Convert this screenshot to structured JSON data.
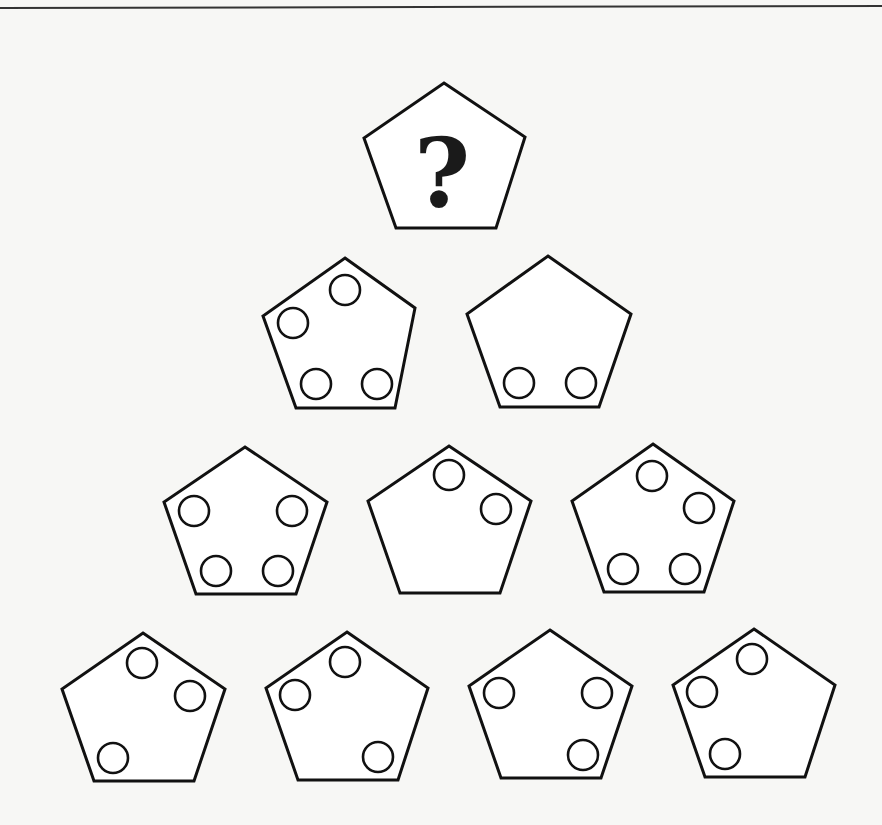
{
  "puzzle": {
    "question_symbol": "?",
    "colors": {
      "background": "#f7f7f5",
      "stroke": "#111111",
      "fill": "#ffffff"
    },
    "question_pentagon": {
      "points": [
        [
          444,
          83
        ],
        [
          525,
          137
        ],
        [
          496,
          228
        ],
        [
          396,
          228
        ],
        [
          364,
          138
        ]
      ]
    },
    "rows": [
      {
        "row": 1,
        "pentagons": [
          {
            "id": "r1-p1",
            "circle_count": 4,
            "points": [
              [
                345,
                258
              ],
              [
                415,
                308
              ],
              [
                395,
                408
              ],
              [
                296,
                408
              ],
              [
                263,
                316
              ]
            ],
            "circles": [
              [
                345,
                290
              ],
              [
                293,
                323
              ],
              [
                316,
                384
              ],
              [
                377,
                384
              ]
            ]
          },
          {
            "id": "r1-p2",
            "circle_count": 2,
            "points": [
              [
                548,
                256
              ],
              [
                631,
                314
              ],
              [
                599,
                407
              ],
              [
                500,
                407
              ],
              [
                467,
                314
              ]
            ],
            "circles": [
              [
                519,
                383
              ],
              [
                581,
                383
              ]
            ]
          }
        ]
      },
      {
        "row": 2,
        "pentagons": [
          {
            "id": "r2-p1",
            "circle_count": 4,
            "points": [
              [
                245,
                447
              ],
              [
                327,
                502
              ],
              [
                296,
                594
              ],
              [
                196,
                594
              ],
              [
                164,
                502
              ]
            ],
            "circles": [
              [
                194,
                511
              ],
              [
                292,
                511
              ],
              [
                216,
                571
              ],
              [
                278,
                571
              ]
            ]
          },
          {
            "id": "r2-p2",
            "circle_count": 2,
            "points": [
              [
                449,
                446
              ],
              [
                531,
                501
              ],
              [
                500,
                593
              ],
              [
                400,
                593
              ],
              [
                368,
                501
              ]
            ],
            "circles": [
              [
                449,
                475
              ],
              [
                496,
                509
              ]
            ]
          },
          {
            "id": "r2-p3",
            "circle_count": 4,
            "points": [
              [
                653,
                444
              ],
              [
                734,
                501
              ],
              [
                704,
                592
              ],
              [
                604,
                592
              ],
              [
                572,
                501
              ]
            ],
            "circles": [
              [
                652,
                476
              ],
              [
                699,
                508
              ],
              [
                623,
                569
              ],
              [
                685,
                569
              ]
            ]
          }
        ]
      },
      {
        "row": 3,
        "pentagons": [
          {
            "id": "r3-p1",
            "circle_count": 3,
            "points": [
              [
                143,
                633
              ],
              [
                225,
                689
              ],
              [
                194,
                781
              ],
              [
                94,
                781
              ],
              [
                62,
                689
              ]
            ],
            "circles": [
              [
                142,
                663
              ],
              [
                190,
                696
              ],
              [
                113,
                758
              ]
            ]
          },
          {
            "id": "r3-p2",
            "circle_count": 3,
            "points": [
              [
                347,
                632
              ],
              [
                428,
                688
              ],
              [
                398,
                780
              ],
              [
                298,
                780
              ],
              [
                266,
                688
              ]
            ],
            "circles": [
              [
                345,
                662
              ],
              [
                295,
                695
              ],
              [
                378,
                757
              ]
            ]
          },
          {
            "id": "r3-p3",
            "circle_count": 3,
            "points": [
              [
                550,
                630
              ],
              [
                632,
                686
              ],
              [
                601,
                778
              ],
              [
                501,
                778
              ],
              [
                469,
                686
              ]
            ],
            "circles": [
              [
                499,
                693
              ],
              [
                597,
                693
              ],
              [
                583,
                755
              ]
            ]
          },
          {
            "id": "r3-p4",
            "circle_count": 3,
            "points": [
              [
                754,
                629
              ],
              [
                835,
                685
              ],
              [
                805,
                777
              ],
              [
                705,
                777
              ],
              [
                673,
                685
              ]
            ],
            "circles": [
              [
                752,
                659
              ],
              [
                702,
                692
              ],
              [
                725,
                754
              ]
            ]
          }
        ]
      }
    ],
    "circle_radius": 15
  }
}
